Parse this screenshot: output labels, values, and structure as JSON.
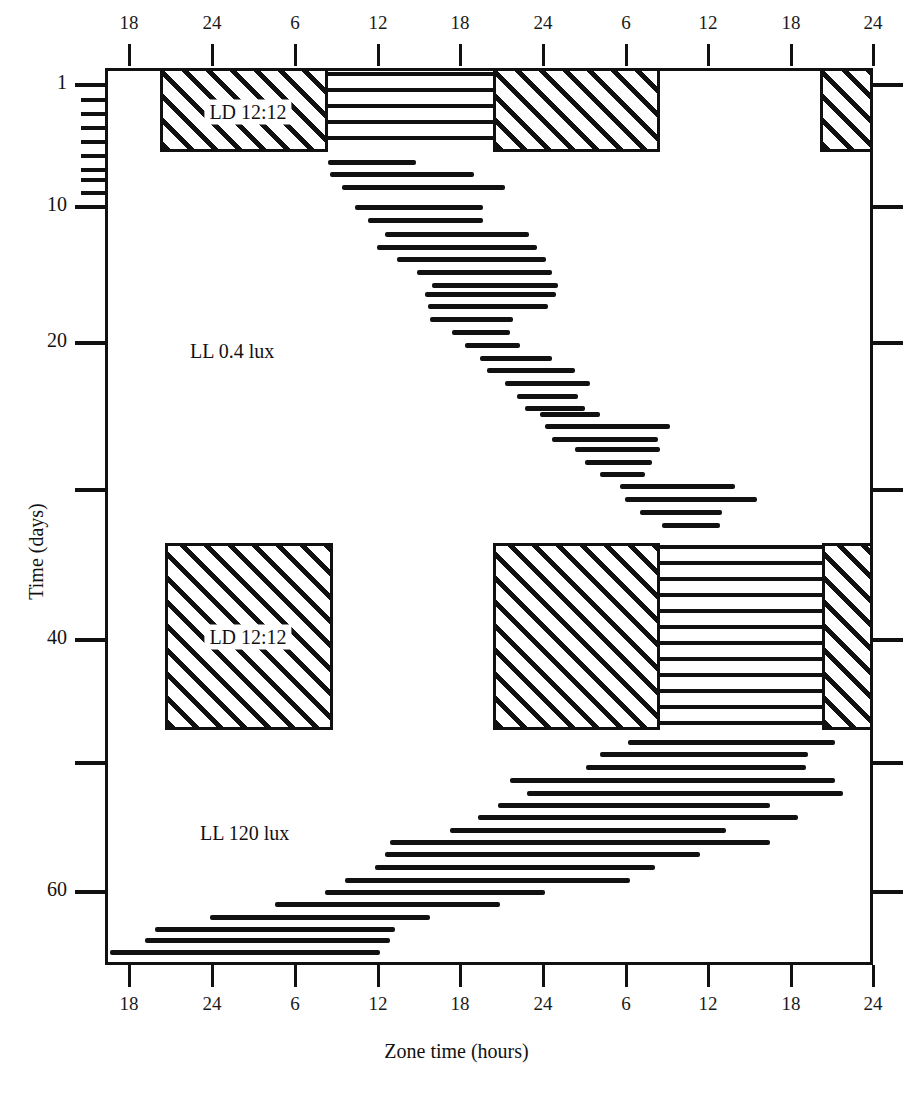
{
  "axes": {
    "x_title": "Zone time (hours)",
    "y_title": "Time (days)",
    "x_ticks": [
      {
        "label": "18",
        "x": 129
      },
      {
        "label": "24",
        "x": 212
      },
      {
        "label": "6",
        "x": 295
      },
      {
        "label": "12",
        "x": 378
      },
      {
        "label": "18",
        "x": 460
      },
      {
        "label": "24",
        "x": 543
      },
      {
        "label": "6",
        "x": 626
      },
      {
        "label": "12",
        "x": 708
      },
      {
        "label": "18",
        "x": 791
      },
      {
        "label": "24",
        "x": 873
      }
    ],
    "y_ticks": [
      {
        "label": "1",
        "y": 85,
        "major": true
      },
      {
        "label": "",
        "y": 100,
        "major": false
      },
      {
        "label": "",
        "y": 114,
        "major": false
      },
      {
        "label": "",
        "y": 128,
        "major": false
      },
      {
        "label": "",
        "y": 142,
        "major": false
      },
      {
        "label": "",
        "y": 156,
        "major": false
      },
      {
        "label": "",
        "y": 170,
        "major": false
      },
      {
        "label": "",
        "y": 180,
        "major": false
      },
      {
        "label": "",
        "y": 193,
        "major": false
      },
      {
        "label": "10",
        "y": 207,
        "major": true
      },
      {
        "label": "20",
        "y": 343,
        "major": true
      },
      {
        "label": "",
        "y": 490,
        "major": true
      },
      {
        "label": "40",
        "y": 640,
        "major": true
      },
      {
        "label": "",
        "y": 763,
        "major": true
      },
      {
        "label": "60",
        "y": 892,
        "major": true
      }
    ]
  },
  "regions": [
    {
      "name": "ll-04-lux",
      "label": "LL 0.4 lux",
      "x": 190,
      "y": 340
    },
    {
      "name": "ll-120-lux",
      "label": "LL 120 lux",
      "x": 200,
      "y": 822
    }
  ],
  "ld_labels": [
    {
      "text": "LD 12:12",
      "x": 248,
      "y": 112
    },
    {
      "text": "LD 12:12",
      "x": 248,
      "y": 637
    }
  ],
  "chart_data": {
    "type": "actogram",
    "title": "",
    "xlabel": "Zone time (hours)",
    "ylabel": "Time (days)",
    "xlim": [
      17.0,
      48.0
    ],
    "ylim": [
      0,
      66
    ],
    "grid": false,
    "legend": null,
    "x_tick_hours": [
      18,
      24,
      30,
      36,
      42,
      48,
      54,
      60,
      66,
      72
    ],
    "x_tick_labels": [
      "18",
      "24",
      "6",
      "12",
      "18",
      "24",
      "6",
      "12",
      "18",
      "24"
    ],
    "y_tick_days": [
      1,
      10,
      20,
      30,
      40,
      50,
      60
    ],
    "double_plotted": true,
    "lighting_blocks": [
      {
        "name": "dark-top-left",
        "type": "dark",
        "x0": 160,
        "x1": 328,
        "y0": 68,
        "y1": 152,
        "pattern": "diagonal-hatch"
      },
      {
        "name": "dark-top-mid",
        "type": "dark",
        "x0": 493,
        "x1": 660,
        "y0": 68,
        "y1": 152,
        "pattern": "diagonal-hatch"
      },
      {
        "name": "dark-top-right",
        "type": "dark",
        "x0": 820,
        "x1": 873,
        "y0": 68,
        "y1": 152,
        "pattern": "diagonal-hatch"
      },
      {
        "name": "dark-bot-left",
        "type": "dark",
        "x0": 165,
        "x1": 333,
        "y0": 543,
        "y1": 730,
        "pattern": "diagonal-hatch"
      },
      {
        "name": "dark-bot-mid",
        "type": "dark",
        "x0": 493,
        "x1": 660,
        "y0": 543,
        "y1": 730,
        "pattern": "diagonal-hatch"
      },
      {
        "name": "dark-bot-right",
        "type": "dark",
        "x0": 822,
        "x1": 873,
        "y0": 543,
        "y1": 730,
        "pattern": "diagonal-hatch"
      }
    ],
    "dense_activity_blocks": [
      {
        "name": "entrained-activity-top",
        "x0": 328,
        "x1": 493,
        "y0": 72,
        "y1": 152
      },
      {
        "name": "entrained-activity-bottom",
        "x0": 660,
        "x1": 822,
        "y0": 545,
        "y1": 730
      }
    ],
    "activity_bars": [
      {
        "day": 7,
        "x0": 328,
        "x1": 416,
        "y": 160
      },
      {
        "day": 8,
        "x0": 330,
        "x1": 474,
        "y": 172
      },
      {
        "day": 9,
        "x0": 342,
        "x1": 505,
        "y": 185
      },
      {
        "day": 10,
        "x0": 355,
        "x1": 483,
        "y": 205
      },
      {
        "day": 11,
        "x0": 368,
        "x1": 483,
        "y": 218
      },
      {
        "day": 12,
        "x0": 385,
        "x1": 529,
        "y": 232
      },
      {
        "day": 13,
        "x0": 377,
        "x1": 537,
        "y": 245
      },
      {
        "day": 14,
        "x0": 397,
        "x1": 546,
        "y": 257
      },
      {
        "day": 15,
        "x0": 417,
        "x1": 552,
        "y": 270
      },
      {
        "day": 16,
        "x0": 432,
        "x1": 558,
        "y": 283
      },
      {
        "day": 17,
        "x0": 425,
        "x1": 556,
        "y": 292
      },
      {
        "day": 18,
        "x0": 428,
        "x1": 548,
        "y": 304
      },
      {
        "day": 19,
        "x0": 430,
        "x1": 513,
        "y": 317
      },
      {
        "day": 20,
        "x0": 452,
        "x1": 510,
        "y": 330
      },
      {
        "day": 21,
        "x0": 465,
        "x1": 520,
        "y": 343
      },
      {
        "day": 22,
        "x0": 480,
        "x1": 552,
        "y": 356
      },
      {
        "day": 23,
        "x0": 487,
        "x1": 575,
        "y": 368
      },
      {
        "day": 24,
        "x0": 505,
        "x1": 590,
        "y": 381
      },
      {
        "day": 25,
        "x0": 517,
        "x1": 578,
        "y": 394
      },
      {
        "day": 26,
        "x0": 525,
        "x1": 585,
        "y": 406
      },
      {
        "day": 27,
        "x0": 540,
        "x1": 600,
        "y": 412
      },
      {
        "day": 28,
        "x0": 545,
        "x1": 670,
        "y": 424
      },
      {
        "day": 29,
        "x0": 552,
        "x1": 658,
        "y": 437
      },
      {
        "day": 30,
        "x0": 575,
        "x1": 660,
        "y": 447
      },
      {
        "day": 31,
        "x0": 585,
        "x1": 652,
        "y": 460
      },
      {
        "day": 32,
        "x0": 600,
        "x1": 645,
        "y": 472
      },
      {
        "day": 33,
        "x0": 620,
        "x1": 735,
        "y": 484
      },
      {
        "day": 34,
        "x0": 625,
        "x1": 757,
        "y": 497
      },
      {
        "day": 35,
        "x0": 640,
        "x1": 722,
        "y": 510
      },
      {
        "day": 36,
        "x0": 662,
        "x1": 720,
        "y": 523
      },
      {
        "day": 47,
        "x0": 628,
        "x1": 835,
        "y": 740
      },
      {
        "day": 48,
        "x0": 600,
        "x1": 808,
        "y": 752
      },
      {
        "day": 49,
        "x0": 586,
        "x1": 806,
        "y": 765
      },
      {
        "day": 50,
        "x0": 510,
        "x1": 835,
        "y": 778
      },
      {
        "day": 51,
        "x0": 527,
        "x1": 843,
        "y": 791
      },
      {
        "day": 52,
        "x0": 498,
        "x1": 770,
        "y": 803
      },
      {
        "day": 53,
        "x0": 478,
        "x1": 798,
        "y": 815
      },
      {
        "day": 54,
        "x0": 450,
        "x1": 726,
        "y": 828
      },
      {
        "day": 55,
        "x0": 390,
        "x1": 770,
        "y": 840
      },
      {
        "day": 56,
        "x0": 385,
        "x1": 700,
        "y": 852
      },
      {
        "day": 57,
        "x0": 375,
        "x1": 655,
        "y": 865
      },
      {
        "day": 58,
        "x0": 345,
        "x1": 630,
        "y": 878
      },
      {
        "day": 59,
        "x0": 325,
        "x1": 545,
        "y": 890
      },
      {
        "day": 60,
        "x0": 275,
        "x1": 500,
        "y": 902
      },
      {
        "day": 61,
        "x0": 210,
        "x1": 430,
        "y": 915
      },
      {
        "day": 62,
        "x0": 155,
        "x1": 395,
        "y": 927
      },
      {
        "day": 63,
        "x0": 145,
        "x1": 390,
        "y": 938
      },
      {
        "day": 64,
        "x0": 110,
        "x1": 380,
        "y": 950
      }
    ]
  }
}
